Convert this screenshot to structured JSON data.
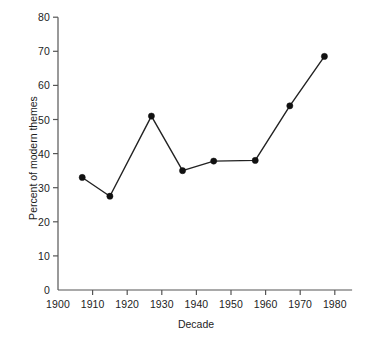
{
  "chart_data": {
    "type": "line",
    "title": "",
    "subtitle": "",
    "xlabel": "Decade",
    "ylabel": "Percent of modern themes",
    "xlim": [
      1900,
      1985
    ],
    "ylim": [
      0,
      80
    ],
    "xticks": [
      1900,
      1910,
      1920,
      1930,
      1940,
      1950,
      1960,
      1970,
      1980
    ],
    "xtick_labels": [
      "1900",
      "1910",
      "1920",
      "1930",
      "1940",
      "1950",
      "1960",
      "1970",
      "1980"
    ],
    "yticks": [
      0,
      10,
      20,
      30,
      40,
      50,
      60,
      70,
      80
    ],
    "ytick_labels": [
      "0",
      "10",
      "20",
      "30",
      "40",
      "50",
      "60",
      "70",
      "80"
    ],
    "grid": false,
    "legend": false,
    "legend_position": "none",
    "marker": "filled-circle",
    "line_color": "#222222",
    "marker_color": "#111111",
    "background_color": "#ffffff",
    "axis_color": "#555555",
    "x": [
      1907,
      1915,
      1927,
      1936,
      1945,
      1957,
      1967,
      1977
    ],
    "values": [
      33,
      27.5,
      51,
      35,
      37.8,
      38,
      54,
      68.5
    ],
    "points": [
      {
        "x": 1907,
        "y": 33
      },
      {
        "x": 1915,
        "y": 27.5
      },
      {
        "x": 1927,
        "y": 51
      },
      {
        "x": 1936,
        "y": 35
      },
      {
        "x": 1945,
        "y": 37.8
      },
      {
        "x": 1957,
        "y": 38
      },
      {
        "x": 1967,
        "y": 54
      },
      {
        "x": 1977,
        "y": 68.5
      }
    ],
    "series": [
      {
        "name": "Percent of modern themes",
        "values": [
          33,
          27.5,
          51,
          35,
          37.8,
          38,
          54,
          68.5
        ]
      }
    ]
  }
}
